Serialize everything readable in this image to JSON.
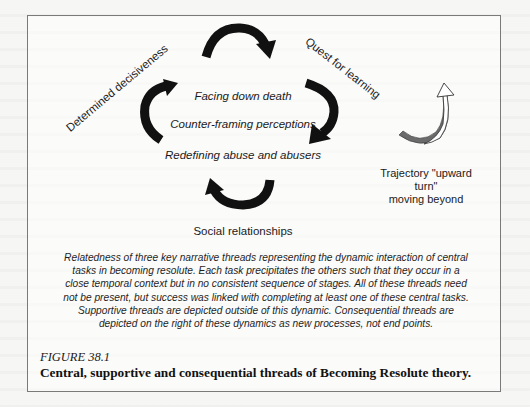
{
  "figure": {
    "number": "FIGURE 38.1",
    "title": "Central, supportive and consequential threads of Becoming Resolute theory.",
    "description": "Relatedness of three key narrative threads representing the dynamic interaction of central tasks in becoming resolute. Each task precipitates the others such that they occur in a close temporal context but in no consistent sequence of stages. All of these threads need not be present, but success was linked with completing at least one of these central tasks. Supportive threads are depicted outside of this dynamic. Consequential threads are depicted on the right of these dynamics as new processes, not end points."
  },
  "diagram": {
    "central_tasks": [
      "Facing down death",
      "Counter-framing perceptions",
      "Redefining abuse and abusers"
    ],
    "supportive_threads": {
      "left": "Determined decisiveness",
      "right": "Quest for learning",
      "bottom": "Social relationships"
    },
    "consequential_thread": {
      "line1": "Trajectory \"upward turn\"",
      "line2": "moving beyond"
    },
    "colors": {
      "cycle_arrows": "#111111",
      "trajectory_arrow_fill": "#6b6b6b",
      "trajectory_arrow_outline": "#333333",
      "box_border": "#7a7a7a"
    }
  }
}
